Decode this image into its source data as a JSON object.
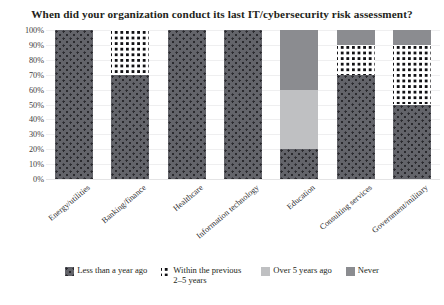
{
  "chart_data": {
    "type": "bar",
    "subtype": "stacked-bar-100",
    "title": "When did your organization conduct its last IT/cybersecurity risk assessment?",
    "xlabel": "",
    "ylabel": "",
    "ylim": [
      0,
      100
    ],
    "ytick_labels": [
      "100%",
      "90%",
      "80%",
      "70%",
      "60%",
      "50%",
      "40%",
      "30%",
      "20%",
      "10%",
      "0%"
    ],
    "ytick_values": [
      100,
      90,
      80,
      70,
      60,
      50,
      40,
      30,
      20,
      10,
      0
    ],
    "grid": true,
    "legend_position": "bottom",
    "categories": [
      "Energy/utilities",
      "Banking/finance",
      "Healthcare",
      "Information technology",
      "Education",
      "Consulting services",
      "Government/military"
    ],
    "series": [
      {
        "name": "Less than a year ago",
        "pattern": "dots",
        "color": "#63646a",
        "values": [
          100,
          70,
          100,
          100,
          20,
          70,
          50
        ]
      },
      {
        "name": "Within the previous 2–5 years",
        "pattern": "checker",
        "color": "#111114",
        "values": [
          0,
          30,
          0,
          0,
          0,
          20,
          40
        ]
      },
      {
        "name": "Over 5 years ago",
        "pattern": "solid-light",
        "color": "#bfc0c2",
        "values": [
          0,
          0,
          0,
          0,
          40,
          0,
          0
        ]
      },
      {
        "name": "Never",
        "pattern": "solid-mid",
        "color": "#8b8c90",
        "values": [
          0,
          0,
          0,
          0,
          40,
          10,
          10
        ]
      }
    ],
    "legend": [
      {
        "label": "Less than a year ago",
        "pattern": "dots"
      },
      {
        "label": "Within the previous 2–5 years",
        "pattern": "checker"
      },
      {
        "label": "Over 5 years ago",
        "pattern": "solid-light"
      },
      {
        "label": "Never",
        "pattern": "solid-mid"
      }
    ]
  }
}
